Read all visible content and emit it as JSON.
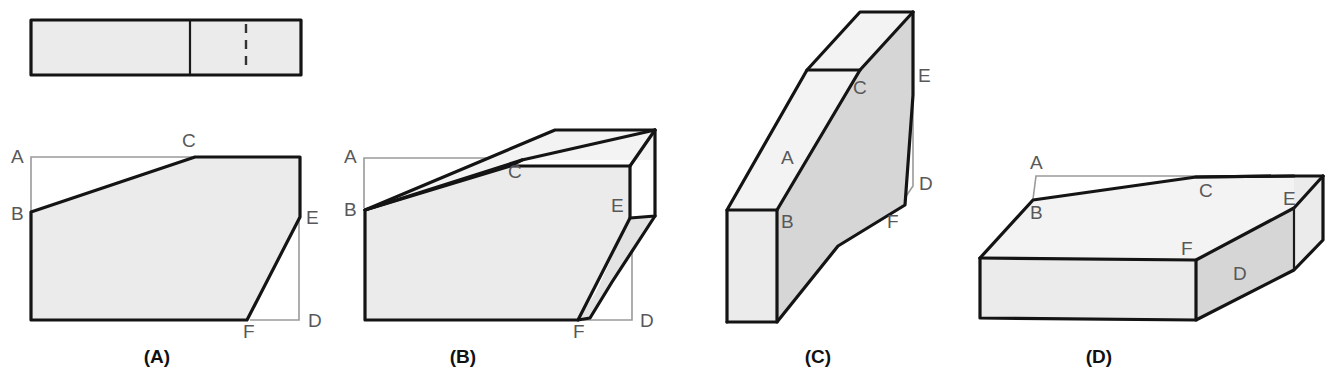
{
  "figure": {
    "background_color": "#ffffff",
    "edge_color": "#141414",
    "leader_color": "#9a9a9a",
    "fill_light": "#ebebeb",
    "fill_mid": "#e3e3e3",
    "fill_dark": "#d6d6d6",
    "vertex_label_color": "#58585a",
    "caption_color": "#111111"
  },
  "top_view": {
    "name": "plan-view-rectangle",
    "description": "Rectangular plan view with one solid divider line and one dashed hidden line",
    "solid_divider": "solid",
    "hidden_divider": "dashed"
  },
  "figures": [
    {
      "id": "A",
      "caption": "(A)",
      "caption_x": 157,
      "caption_y": 363,
      "type": "flat-outline",
      "vertex_labels": [
        {
          "letter": "A",
          "x": 11,
          "y": 163
        },
        {
          "letter": "B",
          "x": 11,
          "y": 220
        },
        {
          "letter": "C",
          "x": 182,
          "y": 147
        },
        {
          "letter": "E",
          "x": 306,
          "y": 224
        },
        {
          "letter": "D",
          "x": 308,
          "y": 327
        },
        {
          "letter": "F",
          "x": 243,
          "y": 338
        }
      ]
    },
    {
      "id": "B",
      "caption": "(B)",
      "caption_x": 463,
      "caption_y": 363,
      "type": "solid-3d",
      "vertex_labels": [
        {
          "letter": "A",
          "x": 344,
          "y": 163
        },
        {
          "letter": "B",
          "x": 344,
          "y": 216
        },
        {
          "letter": "C",
          "x": 508,
          "y": 178
        },
        {
          "letter": "E",
          "x": 611,
          "y": 212
        },
        {
          "letter": "D",
          "x": 640,
          "y": 327
        },
        {
          "letter": "F",
          "x": 573,
          "y": 338
        }
      ]
    },
    {
      "id": "C",
      "caption": "(C)",
      "caption_x": 818,
      "caption_y": 363,
      "type": "solid-3d",
      "vertex_labels": [
        {
          "letter": "C",
          "x": 853,
          "y": 94
        },
        {
          "letter": "E",
          "x": 918,
          "y": 82
        },
        {
          "letter": "A",
          "x": 781,
          "y": 164
        },
        {
          "letter": "D",
          "x": 919,
          "y": 190
        },
        {
          "letter": "B",
          "x": 781,
          "y": 228
        },
        {
          "letter": "F",
          "x": 887,
          "y": 228
        }
      ]
    },
    {
      "id": "D",
      "caption": "(D)",
      "caption_x": 1099,
      "caption_y": 363,
      "type": "solid-3d",
      "vertex_labels": [
        {
          "letter": "A",
          "x": 1030,
          "y": 169
        },
        {
          "letter": "B",
          "x": 1030,
          "y": 219
        },
        {
          "letter": "C",
          "x": 1199,
          "y": 197
        },
        {
          "letter": "E",
          "x": 1283,
          "y": 205
        },
        {
          "letter": "F",
          "x": 1181,
          "y": 255
        },
        {
          "letter": "D",
          "x": 1233,
          "y": 280
        }
      ]
    }
  ]
}
